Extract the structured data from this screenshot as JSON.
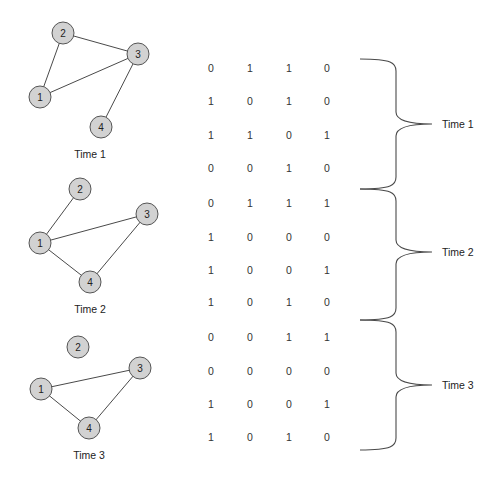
{
  "diagram": {
    "graphs": [
      {
        "label": "Time 1",
        "label_pos": [
          90,
          154
        ],
        "nodes": [
          {
            "id": "1",
            "x": 40,
            "y": 97
          },
          {
            "id": "2",
            "x": 63,
            "y": 33
          },
          {
            "id": "3",
            "x": 138,
            "y": 54
          },
          {
            "id": "4",
            "x": 101,
            "y": 127
          }
        ],
        "edges": [
          [
            "1",
            "2"
          ],
          [
            "2",
            "3"
          ],
          [
            "1",
            "3"
          ],
          [
            "3",
            "4"
          ]
        ]
      },
      {
        "label": "Time 2",
        "label_pos": [
          90,
          309
        ],
        "nodes": [
          {
            "id": "1",
            "x": 40,
            "y": 243
          },
          {
            "id": "2",
            "x": 80,
            "y": 189
          },
          {
            "id": "3",
            "x": 147,
            "y": 214
          },
          {
            "id": "4",
            "x": 90,
            "y": 282
          }
        ],
        "edges": [
          [
            "1",
            "2"
          ],
          [
            "1",
            "3"
          ],
          [
            "1",
            "4"
          ],
          [
            "3",
            "4"
          ]
        ]
      },
      {
        "label": "Time 3",
        "label_pos": [
          89,
          455
        ],
        "nodes": [
          {
            "id": "1",
            "x": 41,
            "y": 389
          },
          {
            "id": "2",
            "x": 78,
            "y": 347
          },
          {
            "id": "3",
            "x": 140,
            "y": 368
          },
          {
            "id": "4",
            "x": 89,
            "y": 428
          }
        ],
        "edges": [
          [
            "1",
            "3"
          ],
          [
            "1",
            "4"
          ],
          [
            "3",
            "4"
          ]
        ]
      }
    ],
    "matrix": {
      "column_x": [
        211,
        250,
        289,
        327
      ],
      "row_y": [
        68,
        101,
        135,
        168,
        203,
        237,
        270,
        302,
        337,
        371,
        404,
        437
      ],
      "rows": [
        [
          0,
          1,
          1,
          0
        ],
        [
          1,
          0,
          1,
          0
        ],
        [
          1,
          1,
          0,
          1
        ],
        [
          0,
          0,
          1,
          0
        ],
        [
          0,
          1,
          1,
          1
        ],
        [
          1,
          0,
          0,
          0
        ],
        [
          1,
          0,
          0,
          1
        ],
        [
          1,
          0,
          1,
          0
        ],
        [
          0,
          0,
          1,
          1
        ],
        [
          0,
          0,
          0,
          0
        ],
        [
          1,
          0,
          0,
          1
        ],
        [
          1,
          0,
          1,
          0
        ]
      ]
    },
    "braces": [
      {
        "label": "Time 1",
        "top": 59,
        "mid": 124,
        "bottom": 189
      },
      {
        "label": "Time 2",
        "top": 189,
        "mid": 252,
        "bottom": 320
      },
      {
        "label": "Time 3",
        "top": 320,
        "mid": 385,
        "bottom": 450
      }
    ],
    "colors": {
      "node_fill": "#d2d2d2",
      "node_stroke": "#555555",
      "edge": "#4a4a4a",
      "text": "#222222"
    }
  }
}
